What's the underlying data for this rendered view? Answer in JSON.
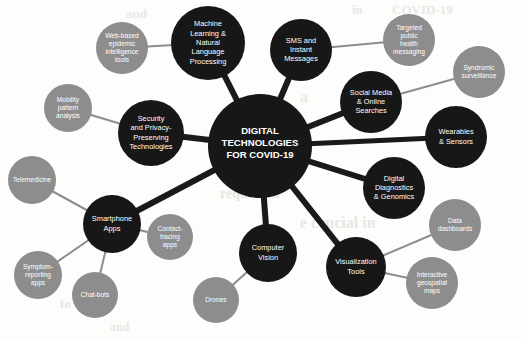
{
  "diagram": {
    "type": "hub-and-spoke network diagram",
    "background_color": "#fdfdfc",
    "colors": {
      "primary_node": "#171717",
      "secondary_node": "#8d8d8d",
      "primary_edge": "#1a1a1a",
      "secondary_edge": "#8d8d8d",
      "node_text": "#ffffff",
      "ghost_text": "#e9e7e4"
    },
    "hub": {
      "id": "hub",
      "label": "DIGITAL TECHNOLOGIES FOR COVID-19",
      "lines": [
        "DIGITAL",
        "TECHNOLOGIES",
        "FOR COVID-19"
      ],
      "cx": 260,
      "cy": 146,
      "r": 52,
      "kind": "hub",
      "font_size": 9.6
    },
    "primary_nodes": [
      {
        "id": "machine-learning",
        "label": "Machine Learning & Natural Language Processing",
        "lines": [
          "Machine",
          "Learning &",
          "Natural",
          "Language",
          "Processing"
        ],
        "cx": 208,
        "cy": 43,
        "r": 37,
        "kind": "primary",
        "font_size": 7.4
      },
      {
        "id": "sms-instant-messages",
        "label": "SMS and Instant Messages",
        "lines": [
          "SMS and",
          "Instant",
          "Messages"
        ],
        "cx": 301,
        "cy": 50,
        "r": 31,
        "kind": "primary",
        "font_size": 7.4
      },
      {
        "id": "social-media-online-searches",
        "label": "Social Media & Online Searches",
        "lines": [
          "Social Media",
          "& Online",
          "Searches"
        ],
        "cx": 371,
        "cy": 102,
        "r": 31,
        "kind": "primary",
        "font_size": 7.4
      },
      {
        "id": "wearables-sensors",
        "label": "Wearables & Sensors",
        "lines": [
          "Wearables",
          "& Sensors"
        ],
        "cx": 456,
        "cy": 137,
        "r": 31,
        "kind": "primary",
        "font_size": 7.4
      },
      {
        "id": "digital-diagnostics-genomics",
        "label": "Digital Diagnostics & Genomics",
        "lines": [
          "Digital",
          "Diagnostics",
          "& Genomics"
        ],
        "cx": 394,
        "cy": 188,
        "r": 31,
        "kind": "primary",
        "font_size": 7.4
      },
      {
        "id": "visualization-tools",
        "label": "Visualization Tools",
        "lines": [
          "Visualization",
          "Tools"
        ],
        "cx": 356,
        "cy": 267,
        "r": 30,
        "kind": "primary",
        "font_size": 7.4
      },
      {
        "id": "computer-vision",
        "label": "Computer Vision",
        "lines": [
          "Computer",
          "Vision"
        ],
        "cx": 268,
        "cy": 253,
        "r": 29,
        "kind": "primary",
        "font_size": 7.4
      },
      {
        "id": "smartphone-apps",
        "label": "Smartphone Apps",
        "lines": [
          "Smartphone",
          "Apps"
        ],
        "cx": 112,
        "cy": 224,
        "r": 29,
        "kind": "primary",
        "font_size": 7.4
      },
      {
        "id": "security-privacy",
        "label": "Security and Privacy-Preserving Technologies",
        "lines": [
          "Security",
          "and Privacy-",
          "Preserving",
          "Technologies"
        ],
        "cx": 151,
        "cy": 133,
        "r": 33,
        "kind": "primary",
        "font_size": 7.4
      }
    ],
    "secondary_nodes": [
      {
        "id": "web-based-epidemic-intelligence-tools",
        "label": "Web-based epidemic intelligence tools",
        "lines": [
          "Web-based",
          "epidemic",
          "intelligence",
          "tools"
        ],
        "cx": 122,
        "cy": 48,
        "r": 26,
        "kind": "secondary",
        "font_size": 6.6,
        "parent": "machine-learning"
      },
      {
        "id": "targeted-public-health-messaging",
        "label": "Targeted public health messaging",
        "lines": [
          "Targeted",
          "public",
          "health",
          "messaging"
        ],
        "cx": 409,
        "cy": 40,
        "r": 26,
        "kind": "secondary",
        "font_size": 6.6,
        "parent": "sms-instant-messages"
      },
      {
        "id": "syndromic-surveillance",
        "label": "Syndromic surveillance",
        "lines": [
          "Syndromic",
          "surveillance"
        ],
        "cx": 479,
        "cy": 72,
        "r": 26,
        "kind": "secondary",
        "font_size": 6.6,
        "parent": "social-media-online-searches"
      },
      {
        "id": "data-dashboards",
        "label": "Data dashboards",
        "lines": [
          "Data",
          "dashboards"
        ],
        "cx": 455,
        "cy": 225,
        "r": 26,
        "kind": "secondary",
        "font_size": 6.6,
        "parent": "visualization-tools"
      },
      {
        "id": "interactive-geospatial-maps",
        "label": "Interactive geospatial maps",
        "lines": [
          "Interactive",
          "geospatial",
          "maps"
        ],
        "cx": 432,
        "cy": 283,
        "r": 26,
        "kind": "secondary",
        "font_size": 6.6,
        "parent": "visualization-tools"
      },
      {
        "id": "drones",
        "label": "Drones",
        "lines": [
          "Drones"
        ],
        "cx": 216,
        "cy": 300,
        "r": 23,
        "kind": "secondary",
        "font_size": 6.6,
        "parent": "computer-vision"
      },
      {
        "id": "contact-tracing-apps",
        "label": "Contact-tracing apps",
        "lines": [
          "Contact-",
          "tracing",
          "apps"
        ],
        "cx": 170,
        "cy": 237,
        "r": 23,
        "kind": "secondary",
        "font_size": 6.6,
        "parent": "smartphone-apps"
      },
      {
        "id": "chat-bots",
        "label": "Chat-bots",
        "lines": [
          "Chat-bots"
        ],
        "cx": 95,
        "cy": 295,
        "r": 23,
        "kind": "secondary",
        "font_size": 6.6,
        "parent": "smartphone-apps"
      },
      {
        "id": "symptom-reporting-apps",
        "label": "Symptom-reporting apps",
        "lines": [
          "Symptom-",
          "reporting",
          "apps"
        ],
        "cx": 38,
        "cy": 275,
        "r": 24,
        "kind": "secondary",
        "font_size": 6.6,
        "parent": "smartphone-apps"
      },
      {
        "id": "telemedicine",
        "label": "Telemedicine",
        "lines": [
          "Telemedicine"
        ],
        "cx": 32,
        "cy": 180,
        "r": 24,
        "kind": "secondary",
        "font_size": 6.6,
        "parent": "smartphone-apps"
      },
      {
        "id": "mobility-pattern-analysis",
        "label": "Mobility pattern analysis",
        "lines": [
          "Mobility",
          "pattern",
          "analysis"
        ],
        "cx": 68,
        "cy": 108,
        "r": 24,
        "kind": "secondary",
        "font_size": 6.6,
        "parent": "security-privacy"
      }
    ],
    "primary_edges": [
      {
        "id": "hub-machine-learning",
        "from": "hub",
        "to": "machine-learning",
        "width": 6
      },
      {
        "id": "hub-sms-instant-messages",
        "from": "hub",
        "to": "sms-instant-messages",
        "width": 6
      },
      {
        "id": "hub-social-media-online-searches",
        "from": "hub",
        "to": "social-media-online-searches",
        "width": 6
      },
      {
        "id": "hub-wearables-sensors",
        "from": "hub",
        "to": "wearables-sensors",
        "width": 5
      },
      {
        "id": "hub-digital-diagnostics-genomics",
        "from": "hub",
        "to": "digital-diagnostics-genomics",
        "width": 6
      },
      {
        "id": "hub-visualization-tools",
        "from": "hub",
        "to": "visualization-tools",
        "width": 6
      },
      {
        "id": "hub-computer-vision",
        "from": "hub",
        "to": "computer-vision",
        "width": 6
      },
      {
        "id": "hub-smartphone-apps",
        "from": "hub",
        "to": "smartphone-apps",
        "width": 6
      },
      {
        "id": "hub-security-privacy",
        "from": "hub",
        "to": "security-privacy",
        "width": 6
      }
    ],
    "secondary_edges": [
      {
        "id": "machine-learning-web-based",
        "from": "machine-learning",
        "to": "web-based-epidemic-intelligence-tools",
        "width": 2
      },
      {
        "id": "sms-targeted-messaging",
        "from": "sms-instant-messages",
        "to": "targeted-public-health-messaging",
        "width": 2
      },
      {
        "id": "social-media-syndromic",
        "from": "social-media-online-searches",
        "to": "syndromic-surveillance",
        "width": 2
      },
      {
        "id": "visualization-data-dashboards",
        "from": "visualization-tools",
        "to": "data-dashboards",
        "width": 2
      },
      {
        "id": "visualization-interactive-maps",
        "from": "visualization-tools",
        "to": "interactive-geospatial-maps",
        "width": 2
      },
      {
        "id": "computer-vision-drones",
        "from": "computer-vision",
        "to": "drones",
        "width": 2
      },
      {
        "id": "smartphone-contact-tracing",
        "from": "smartphone-apps",
        "to": "contact-tracing-apps",
        "width": 2
      },
      {
        "id": "smartphone-chat-bots",
        "from": "smartphone-apps",
        "to": "chat-bots",
        "width": 2
      },
      {
        "id": "smartphone-symptom-reporting",
        "from": "smartphone-apps",
        "to": "symptom-reporting-apps",
        "width": 2
      },
      {
        "id": "smartphone-telemedicine",
        "from": "smartphone-apps",
        "to": "telemedicine",
        "width": 2
      },
      {
        "id": "security-mobility-pattern",
        "from": "security-privacy",
        "to": "mobility-pattern-analysis",
        "width": 2
      }
    ],
    "ghost_text_artifacts": [
      {
        "text": "and",
        "x": 126,
        "y": 6,
        "size": 13
      },
      {
        "text": "in",
        "x": 352,
        "y": 2,
        "size": 13
      },
      {
        "text": "COVID-19",
        "x": 392,
        "y": 2,
        "size": 13
      },
      {
        "text": "a",
        "x": 300,
        "y": 88,
        "size": 16
      },
      {
        "text": "requires a",
        "x": 220,
        "y": 186,
        "size": 14
      },
      {
        "text": "e crucial in",
        "x": 300,
        "y": 214,
        "size": 16
      },
      {
        "text": "to",
        "x": 60,
        "y": 296,
        "size": 13
      },
      {
        "text": "and",
        "x": 110,
        "y": 320,
        "size": 12
      }
    ]
  }
}
